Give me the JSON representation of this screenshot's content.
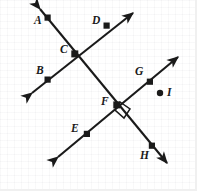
{
  "figure": {
    "width": 197,
    "height": 191,
    "background_color": "#ffffff",
    "stroke_color": "#1a1a1a",
    "point_color": "#1a1a1a"
  },
  "labels": {
    "A": "A",
    "B": "B",
    "C": "C",
    "D": "D",
    "E": "E",
    "F": "F",
    "G": "G",
    "H": "H",
    "I": "I"
  },
  "geometry": {
    "lines": [
      {
        "name": "line-b-c-d",
        "from": [
          32,
          93
        ],
        "to": [
          133,
          13
        ],
        "arrows": "both",
        "points_on_line": [
          "B",
          "C",
          "D"
        ]
      },
      {
        "name": "line-a-c-f-h",
        "from": [
          40,
          9
        ],
        "to": [
          167,
          163
        ],
        "arrows": "both",
        "points_on_line": [
          "A",
          "C",
          "F",
          "H"
        ]
      },
      {
        "name": "line-e-f-g",
        "from": [
          58,
          157
        ],
        "to": [
          178,
          57
        ],
        "arrows": "both",
        "points_on_line": [
          "E",
          "F",
          "G"
        ]
      }
    ],
    "points": [
      {
        "id": "A",
        "x": 48,
        "y": 18,
        "label_x": 34,
        "label_y": 15,
        "kind": "square"
      },
      {
        "id": "B",
        "x": 48,
        "y": 80,
        "label_x": 36,
        "label_y": 65,
        "kind": "square"
      },
      {
        "id": "C",
        "x": 75,
        "y": 54,
        "label_x": 60,
        "label_y": 44,
        "kind": "square"
      },
      {
        "id": "D",
        "x": 107,
        "y": 26,
        "label_x": 92,
        "label_y": 15,
        "kind": "square"
      },
      {
        "id": "E",
        "x": 87,
        "y": 134,
        "label_x": 71,
        "label_y": 123,
        "kind": "square"
      },
      {
        "id": "F",
        "x": 117,
        "y": 105,
        "label_x": 101,
        "label_y": 96,
        "kind": "square"
      },
      {
        "id": "G",
        "x": 150,
        "y": 82,
        "label_x": 135,
        "label_y": 66,
        "kind": "square"
      },
      {
        "id": "H",
        "x": 152,
        "y": 146,
        "label_x": 140,
        "label_y": 150,
        "kind": "square"
      },
      {
        "id": "I",
        "x": 160,
        "y": 93,
        "label_x": 167,
        "label_y": 87,
        "kind": "round"
      }
    ],
    "right_angle_marker": {
      "at_point": "F",
      "vertices": "120,102 130,109 124,118 115,110"
    }
  }
}
